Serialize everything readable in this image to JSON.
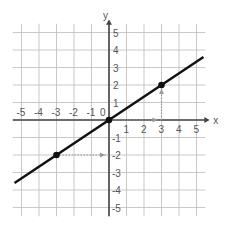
{
  "chart_data": {
    "type": "line",
    "title": "",
    "xlabel": "x",
    "ylabel": "y",
    "xlim": [
      -5.5,
      5.5
    ],
    "ylim": [
      -5.5,
      5.5
    ],
    "grid": true,
    "x_ticks": [
      "-5",
      "-4",
      "-3",
      "-2",
      "-1",
      "0",
      "1",
      "2",
      "3",
      "4",
      "5"
    ],
    "y_ticks": [
      "-5",
      "-4",
      "-3",
      "-2",
      "-1",
      "1",
      "2",
      "3",
      "4",
      "5"
    ],
    "series": [
      {
        "name": "y = (2/3)x",
        "x": [
          -5.4,
          5.4
        ],
        "y": [
          -3.6,
          3.6
        ]
      }
    ],
    "points": [
      {
        "x": -3,
        "y": -2
      },
      {
        "x": 0,
        "y": 0
      },
      {
        "x": 3,
        "y": 2
      }
    ],
    "annotations": [
      {
        "type": "dotted-arrow",
        "from": [
          -3,
          -2
        ],
        "to": [
          0,
          -2
        ]
      },
      {
        "type": "dotted-arrow",
        "from": [
          0,
          0
        ],
        "to": [
          3,
          0
        ]
      },
      {
        "type": "dotted-arrow",
        "from": [
          3,
          0
        ],
        "to": [
          3,
          2
        ]
      }
    ]
  }
}
